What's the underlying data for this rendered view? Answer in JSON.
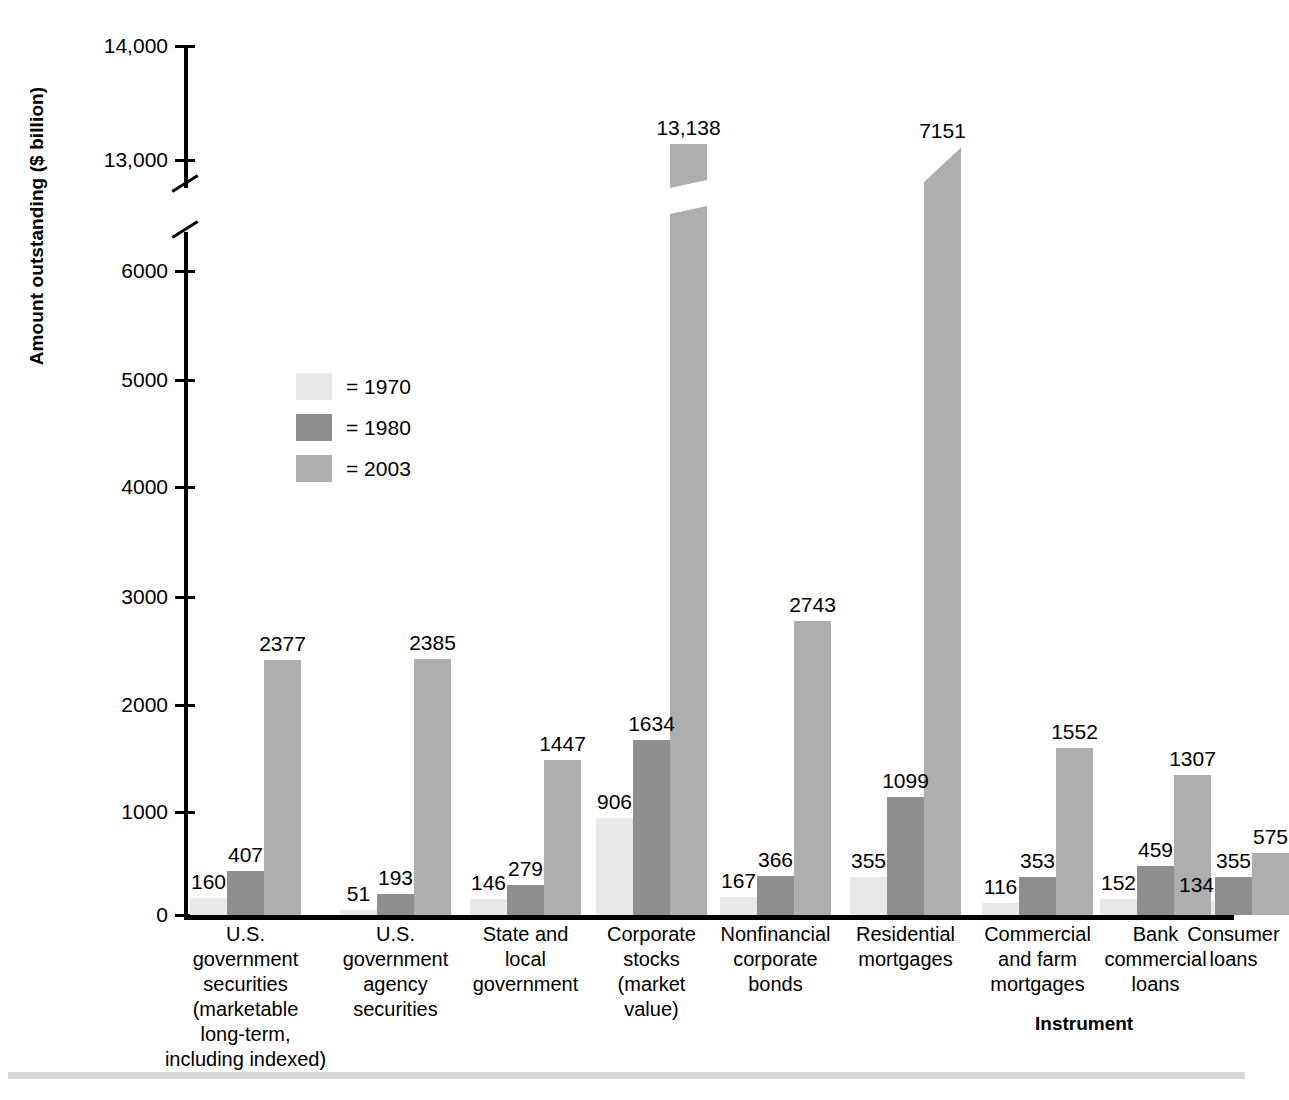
{
  "axes": {
    "ylabel": "Amount outstanding ($ billion)",
    "xlabel": "Instrument",
    "yticks": [
      "14,000",
      "13,000",
      "6000",
      "5000",
      "4000",
      "3000",
      "2000",
      "1000",
      "0"
    ]
  },
  "legend": {
    "items": [
      {
        "label": "= 1970",
        "color": "#e9e9e9"
      },
      {
        "label": "= 1980",
        "color": "#8e8e8e"
      },
      {
        "label": "= 2003",
        "color": "#aeaeae"
      }
    ]
  },
  "chart_data": {
    "type": "bar",
    "title": "",
    "xlabel": "Instrument",
    "ylabel": "Amount outstanding ($ billion)",
    "ylim": [
      0,
      14000
    ],
    "axis_break": {
      "lower": 6500,
      "upper": 12700,
      "note": "broken y-axis between 6000-level segment and 13,000"
    },
    "grid": false,
    "legend_position": "inside-left",
    "categories": [
      "U.S. government securities (marketable long-term, including indexed)",
      "U.S. government agency securities",
      "State and local government",
      "Corporate stocks (market value)",
      "Nonfinancial corporate bonds",
      "Residential mortgages",
      "Commercial and farm mortgages",
      "Bank commercial loans",
      "Consumer loans"
    ],
    "category_lines": [
      [
        "U.S.",
        "government",
        "securities",
        "(marketable",
        "long-term,",
        "including indexed)"
      ],
      [
        "U.S.",
        "government",
        "agency",
        "securities"
      ],
      [
        "State and",
        "local",
        "government"
      ],
      [
        "Corporate",
        "stocks",
        "(market",
        "value)"
      ],
      [
        "Nonfinancial",
        "corporate",
        "bonds"
      ],
      [
        "Residential",
        "mortgages"
      ],
      [
        "Commercial",
        "and farm",
        "mortgages"
      ],
      [
        "Bank",
        "commercial",
        "loans"
      ],
      [
        "Consumer",
        "loans"
      ]
    ],
    "series": [
      {
        "name": "1970",
        "color": "#e9e9e9",
        "values": [
          160,
          51,
          146,
          906,
          167,
          355,
          116,
          152,
          134
        ]
      },
      {
        "name": "1980",
        "color": "#8e8e8e",
        "values": [
          407,
          193,
          279,
          1634,
          366,
          1099,
          353,
          459,
          355
        ]
      },
      {
        "name": "2003",
        "color": "#aeaeae",
        "values": [
          2377,
          2385,
          1447,
          13138,
          2743,
          7151,
          1552,
          1307,
          575
        ]
      }
    ],
    "value_labels": [
      [
        "160",
        "407",
        "2377"
      ],
      [
        "51",
        "193",
        "2385"
      ],
      [
        "146",
        "279",
        "1447"
      ],
      [
        "906",
        "1634",
        "13,138"
      ],
      [
        "167",
        "366",
        "2743"
      ],
      [
        "355",
        "1099",
        "7151"
      ],
      [
        "116",
        "353",
        "1552"
      ],
      [
        "152",
        "459",
        "1307"
      ],
      [
        "134",
        "355",
        "575"
      ]
    ]
  }
}
